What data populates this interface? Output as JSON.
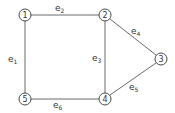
{
  "graph": {
    "nodes": [
      {
        "id": "1",
        "label": "1",
        "x": 25,
        "y": 15
      },
      {
        "id": "2",
        "label": "2",
        "x": 105,
        "y": 15
      },
      {
        "id": "3",
        "label": "3",
        "x": 161,
        "y": 59
      },
      {
        "id": "4",
        "label": "4",
        "x": 105,
        "y": 99
      },
      {
        "id": "5",
        "label": "5",
        "x": 25,
        "y": 99
      }
    ],
    "edges": [
      {
        "id": "e1",
        "letter": "e",
        "sub": "1",
        "from": "1",
        "to": "5"
      },
      {
        "id": "e2",
        "letter": "e",
        "sub": "2",
        "from": "1",
        "to": "2"
      },
      {
        "id": "e3",
        "letter": "e",
        "sub": "3",
        "from": "2",
        "to": "4"
      },
      {
        "id": "e4",
        "letter": "e",
        "sub": "4",
        "from": "2",
        "to": "3"
      },
      {
        "id": "e5",
        "letter": "e",
        "sub": "5",
        "from": "4",
        "to": "3"
      },
      {
        "id": "e6",
        "letter": "e",
        "sub": "6",
        "from": "5",
        "to": "4"
      }
    ]
  }
}
